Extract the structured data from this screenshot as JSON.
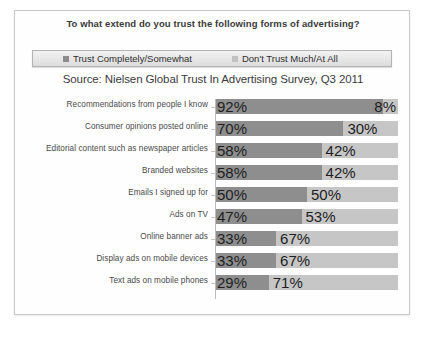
{
  "chart": {
    "title": "To what extend do you trust the following forms of advertising?",
    "source": "Source: Nielsen Global Trust In Advertising Survey, Q3 2011",
    "legend": {
      "trust_label": "Trust Completely/Somewhat",
      "dont_label": "Don't Trust Much/At All",
      "trust_color": "#8e8e8e",
      "dont_color": "#c6c6c6"
    }
  },
  "chart_data": {
    "type": "bar",
    "orientation": "horizontal",
    "stacked": true,
    "title": "To what extend do you trust the following forms of advertising?",
    "subtitle": "Source: Nielsen Global Trust In Advertising Survey, Q3 2011",
    "xlabel": "",
    "ylabel": "",
    "xlim": [
      0,
      100
    ],
    "grid": false,
    "legend_position": "top",
    "categories": [
      "Recommendations from people I know",
      "Consumer opinions posted online",
      "Editorial content such as newspaper articles",
      "Branded websites",
      "Emails I signed up for",
      "Ads on TV",
      "Online banner ads",
      "Display ads on mobile devices",
      "Text ads on mobile phones"
    ],
    "series": [
      {
        "name": "Trust Completely/Somewhat",
        "color": "#8e8e8e",
        "values": [
          92,
          70,
          58,
          58,
          50,
          47,
          33,
          33,
          29
        ],
        "labels": [
          "92%",
          "70%",
          "58%",
          "58%",
          "50%",
          "47%",
          "33%",
          "33%",
          "29%"
        ]
      },
      {
        "name": "Don't Trust Much/At All",
        "color": "#c6c6c6",
        "values": [
          8,
          30,
          42,
          42,
          50,
          53,
          67,
          67,
          71
        ],
        "labels": [
          "8%",
          "30%",
          "42%",
          "42%",
          "50%",
          "53%",
          "67%",
          "67%",
          "71%"
        ]
      }
    ]
  }
}
